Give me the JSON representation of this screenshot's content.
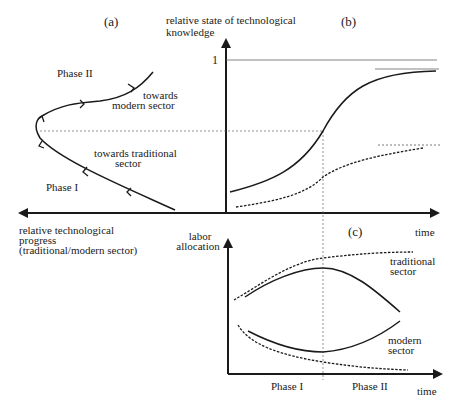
{
  "panels": {
    "a": {
      "label": "(a)"
    },
    "b": {
      "label": "(b)"
    },
    "c": {
      "label": "(c)"
    }
  },
  "axes": {
    "b_y_label_line1": "relative state of technological",
    "b_y_label_line2": "knowledge",
    "b_y_tick": "1",
    "b_x_label": "time",
    "a_x_label_line1": "relative technological",
    "a_x_label_line2": "progress",
    "a_x_label_line3": "(traditional/modern sector)",
    "c_y_label_line1": "labor",
    "c_y_label_line2": "allocation",
    "c_x_label": "time"
  },
  "annotations": {
    "a_phase2": "Phase II",
    "a_phase1": "Phase I",
    "a_towards_modern_1": "towards",
    "a_towards_modern_2": "modern sector",
    "a_towards_trad_1": "towards traditional",
    "a_towards_trad_2": "sector",
    "c_traditional_1": "traditional",
    "c_traditional_2": "sector",
    "c_modern_1": "modern",
    "c_modern_2": "sector",
    "c_phase1": "Phase I",
    "c_phase2": "Phase II"
  },
  "colors": {
    "line": "#1a1a1a",
    "guide": "#555555"
  }
}
